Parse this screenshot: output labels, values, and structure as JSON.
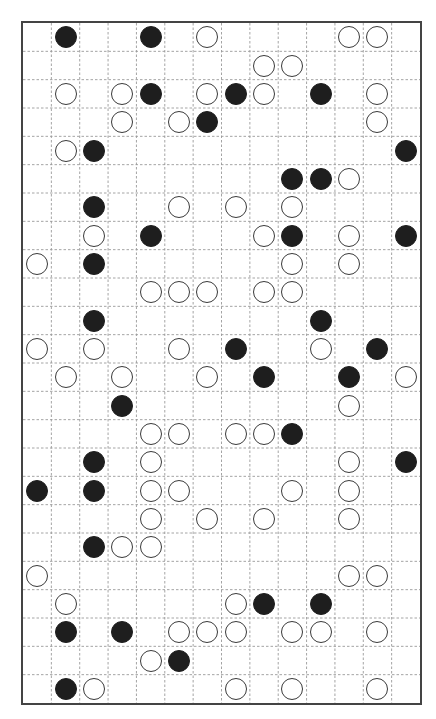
{
  "board": {
    "cols": 14,
    "rows": 24,
    "colors": {
      "border": "#444444",
      "grid_line": "#9a9a9a",
      "black_stone": "#1e1e1e",
      "white_stone_fill": "#ffffff",
      "white_stone_stroke": "#3a3a3a"
    },
    "stones": [
      {
        "r": 0,
        "c": 1,
        "color": "black"
      },
      {
        "r": 0,
        "c": 4,
        "color": "black"
      },
      {
        "r": 0,
        "c": 6,
        "color": "white"
      },
      {
        "r": 0,
        "c": 11,
        "color": "white"
      },
      {
        "r": 0,
        "c": 12,
        "color": "white"
      },
      {
        "r": 1,
        "c": 8,
        "color": "white"
      },
      {
        "r": 1,
        "c": 9,
        "color": "white"
      },
      {
        "r": 2,
        "c": 1,
        "color": "white"
      },
      {
        "r": 2,
        "c": 3,
        "color": "white"
      },
      {
        "r": 2,
        "c": 4,
        "color": "black"
      },
      {
        "r": 2,
        "c": 6,
        "color": "white"
      },
      {
        "r": 2,
        "c": 7,
        "color": "black"
      },
      {
        "r": 2,
        "c": 8,
        "color": "white"
      },
      {
        "r": 2,
        "c": 10,
        "color": "black"
      },
      {
        "r": 2,
        "c": 12,
        "color": "white"
      },
      {
        "r": 3,
        "c": 3,
        "color": "white"
      },
      {
        "r": 3,
        "c": 5,
        "color": "white"
      },
      {
        "r": 3,
        "c": 6,
        "color": "black"
      },
      {
        "r": 3,
        "c": 12,
        "color": "white"
      },
      {
        "r": 4,
        "c": 1,
        "color": "white"
      },
      {
        "r": 4,
        "c": 2,
        "color": "black"
      },
      {
        "r": 4,
        "c": 13,
        "color": "black"
      },
      {
        "r": 5,
        "c": 9,
        "color": "black"
      },
      {
        "r": 5,
        "c": 10,
        "color": "black"
      },
      {
        "r": 5,
        "c": 11,
        "color": "white"
      },
      {
        "r": 6,
        "c": 2,
        "color": "black"
      },
      {
        "r": 6,
        "c": 5,
        "color": "white"
      },
      {
        "r": 6,
        "c": 7,
        "color": "white"
      },
      {
        "r": 6,
        "c": 9,
        "color": "white"
      },
      {
        "r": 7,
        "c": 2,
        "color": "white"
      },
      {
        "r": 7,
        "c": 4,
        "color": "black"
      },
      {
        "r": 7,
        "c": 8,
        "color": "white"
      },
      {
        "r": 7,
        "c": 9,
        "color": "black"
      },
      {
        "r": 7,
        "c": 11,
        "color": "white"
      },
      {
        "r": 7,
        "c": 13,
        "color": "black"
      },
      {
        "r": 8,
        "c": 0,
        "color": "white"
      },
      {
        "r": 8,
        "c": 2,
        "color": "black"
      },
      {
        "r": 8,
        "c": 9,
        "color": "white"
      },
      {
        "r": 8,
        "c": 11,
        "color": "white"
      },
      {
        "r": 9,
        "c": 4,
        "color": "white"
      },
      {
        "r": 9,
        "c": 5,
        "color": "white"
      },
      {
        "r": 9,
        "c": 6,
        "color": "white"
      },
      {
        "r": 9,
        "c": 8,
        "color": "white"
      },
      {
        "r": 9,
        "c": 9,
        "color": "white"
      },
      {
        "r": 10,
        "c": 2,
        "color": "black"
      },
      {
        "r": 10,
        "c": 10,
        "color": "black"
      },
      {
        "r": 11,
        "c": 0,
        "color": "white"
      },
      {
        "r": 11,
        "c": 2,
        "color": "white"
      },
      {
        "r": 11,
        "c": 5,
        "color": "white"
      },
      {
        "r": 11,
        "c": 7,
        "color": "black"
      },
      {
        "r": 11,
        "c": 10,
        "color": "white"
      },
      {
        "r": 11,
        "c": 12,
        "color": "black"
      },
      {
        "r": 12,
        "c": 1,
        "color": "white"
      },
      {
        "r": 12,
        "c": 3,
        "color": "white"
      },
      {
        "r": 12,
        "c": 6,
        "color": "white"
      },
      {
        "r": 12,
        "c": 8,
        "color": "black"
      },
      {
        "r": 12,
        "c": 11,
        "color": "black"
      },
      {
        "r": 12,
        "c": 13,
        "color": "white"
      },
      {
        "r": 13,
        "c": 3,
        "color": "black"
      },
      {
        "r": 13,
        "c": 11,
        "color": "white"
      },
      {
        "r": 14,
        "c": 4,
        "color": "white"
      },
      {
        "r": 14,
        "c": 5,
        "color": "white"
      },
      {
        "r": 14,
        "c": 7,
        "color": "white"
      },
      {
        "r": 14,
        "c": 8,
        "color": "white"
      },
      {
        "r": 14,
        "c": 9,
        "color": "black"
      },
      {
        "r": 15,
        "c": 2,
        "color": "black"
      },
      {
        "r": 15,
        "c": 4,
        "color": "white"
      },
      {
        "r": 15,
        "c": 11,
        "color": "white"
      },
      {
        "r": 15,
        "c": 13,
        "color": "black"
      },
      {
        "r": 16,
        "c": 0,
        "color": "black"
      },
      {
        "r": 16,
        "c": 2,
        "color": "black"
      },
      {
        "r": 16,
        "c": 4,
        "color": "white"
      },
      {
        "r": 16,
        "c": 5,
        "color": "white"
      },
      {
        "r": 16,
        "c": 9,
        "color": "white"
      },
      {
        "r": 16,
        "c": 11,
        "color": "white"
      },
      {
        "r": 17,
        "c": 4,
        "color": "white"
      },
      {
        "r": 17,
        "c": 6,
        "color": "white"
      },
      {
        "r": 17,
        "c": 8,
        "color": "white"
      },
      {
        "r": 17,
        "c": 11,
        "color": "white"
      },
      {
        "r": 18,
        "c": 2,
        "color": "black"
      },
      {
        "r": 18,
        "c": 3,
        "color": "white"
      },
      {
        "r": 18,
        "c": 4,
        "color": "white"
      },
      {
        "r": 19,
        "c": 0,
        "color": "white"
      },
      {
        "r": 19,
        "c": 11,
        "color": "white"
      },
      {
        "r": 19,
        "c": 12,
        "color": "white"
      },
      {
        "r": 20,
        "c": 1,
        "color": "white"
      },
      {
        "r": 20,
        "c": 7,
        "color": "white"
      },
      {
        "r": 20,
        "c": 8,
        "color": "black"
      },
      {
        "r": 20,
        "c": 10,
        "color": "black"
      },
      {
        "r": 21,
        "c": 1,
        "color": "black"
      },
      {
        "r": 21,
        "c": 3,
        "color": "black"
      },
      {
        "r": 21,
        "c": 5,
        "color": "white"
      },
      {
        "r": 21,
        "c": 6,
        "color": "white"
      },
      {
        "r": 21,
        "c": 7,
        "color": "white"
      },
      {
        "r": 21,
        "c": 9,
        "color": "white"
      },
      {
        "r": 21,
        "c": 10,
        "color": "white"
      },
      {
        "r": 21,
        "c": 12,
        "color": "white"
      },
      {
        "r": 22,
        "c": 4,
        "color": "white"
      },
      {
        "r": 22,
        "c": 5,
        "color": "black"
      },
      {
        "r": 23,
        "c": 1,
        "color": "black"
      },
      {
        "r": 23,
        "c": 2,
        "color": "white"
      },
      {
        "r": 23,
        "c": 7,
        "color": "white"
      },
      {
        "r": 23,
        "c": 9,
        "color": "white"
      },
      {
        "r": 23,
        "c": 12,
        "color": "white"
      }
    ]
  }
}
